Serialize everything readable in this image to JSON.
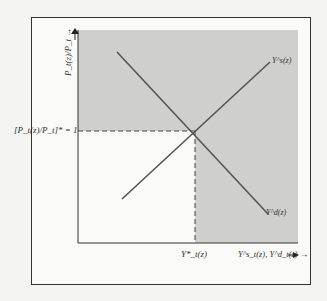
{
  "figure": {
    "y_axis_label": "P_t(z)/P_t →",
    "x_axis_label": "Y^s_t(z), Y^d_t(z) →",
    "equilibrium_price_label": "[P_t(z)/P_t]* = 1",
    "equilibrium_quantity_label": "Y*_t(z)",
    "supply_curve_label": "Y^s(z)",
    "demand_curve_label": "Y^d(z)"
  },
  "colors": {
    "shaded_region": "#cfcfcd",
    "lines": "#555555",
    "frame": "#333333",
    "background": "#fafaf8"
  }
}
